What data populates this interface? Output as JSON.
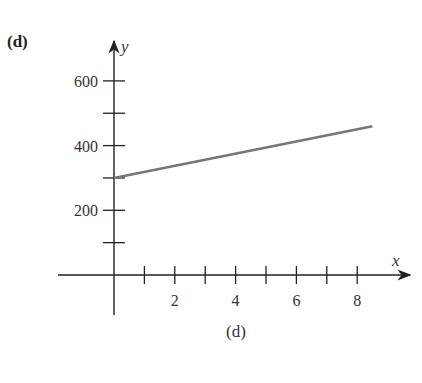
{
  "panel_label": "(d)",
  "caption": "(d)",
  "chart_data": {
    "type": "line",
    "title": "",
    "xlabel": "x",
    "ylabel": "y",
    "xlim": [
      0,
      8.5
    ],
    "ylim": [
      0,
      600
    ],
    "x_ticks": [
      1,
      2,
      3,
      4,
      5,
      6,
      7,
      8
    ],
    "x_tick_labels": [
      "",
      "2",
      "",
      "4",
      "",
      "6",
      "",
      "8"
    ],
    "y_ticks": [
      100,
      200,
      300,
      400,
      500,
      600
    ],
    "y_tick_labels": [
      "",
      "200",
      "",
      "400",
      "",
      "600"
    ],
    "grid": false,
    "legend": null,
    "series": [
      {
        "name": "line",
        "x": [
          0,
          8.5
        ],
        "y": [
          300,
          460
        ],
        "color": "#777777"
      }
    ]
  }
}
